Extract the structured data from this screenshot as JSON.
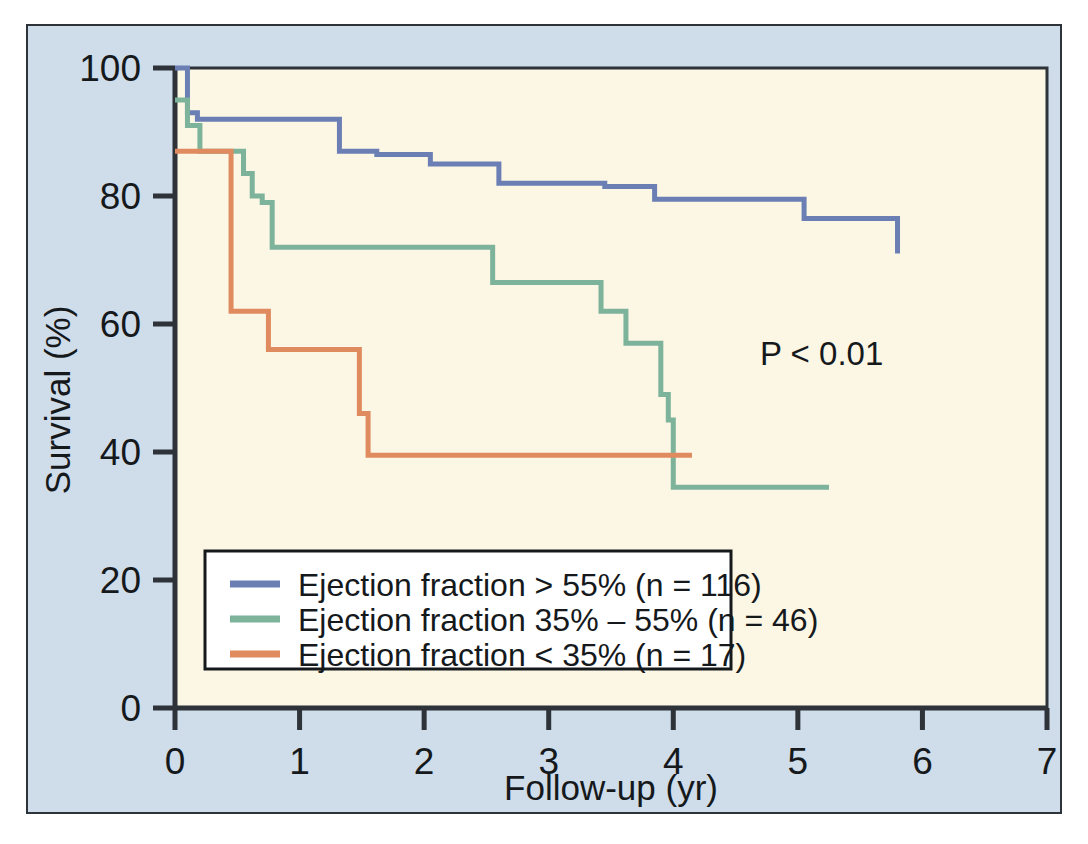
{
  "figure": {
    "background_color": "#cfdcea",
    "panel_color": "#fcf6e4",
    "frame_color": "#2d3338"
  },
  "annotation": {
    "p_value": "P < 0.01"
  },
  "legend": {
    "items": [
      {
        "label": "Ejection fraction > 55% (n = 116)",
        "color": "#6b7fb5"
      },
      {
        "label": "Ejection fraction 35% – 55% (n = 46)",
        "color": "#7cb39a"
      },
      {
        "label": "Ejection fraction < 35% (n = 17)",
        "color": "#e08b5f"
      }
    ]
  },
  "chart_data": {
    "type": "line",
    "title": "",
    "subtitle": "",
    "xlabel": "Follow-up (yr)",
    "ylabel": "Survival (%)",
    "xlim": [
      0,
      7
    ],
    "ylim": [
      0,
      100
    ],
    "xticks": [
      0,
      1,
      2,
      3,
      4,
      5,
      6,
      7
    ],
    "xticklabels": [
      "0",
      "1",
      "2",
      "3",
      "4",
      "5",
      "6",
      "7"
    ],
    "yticks": [
      0,
      20,
      40,
      60,
      80,
      100
    ],
    "yticklabels": [
      "0",
      "20",
      "40",
      "60",
      "80",
      "100"
    ],
    "grid": false,
    "legend_position": "lower-left",
    "annotations": [
      {
        "text": "P < 0.01",
        "x": 4.55,
        "y": 54
      }
    ],
    "step_style": "post",
    "series": [
      {
        "name": "Ejection fraction > 55% (n = 116)",
        "color": "#6b7fb5",
        "n": 116,
        "x": [
          0.0,
          0.06,
          0.1,
          0.18,
          0.72,
          1.32,
          1.62,
          2.05,
          2.6,
          3.35,
          3.45,
          3.85,
          5.05,
          5.12,
          5.8
        ],
        "y": [
          100,
          100,
          93,
          92,
          92,
          87,
          86.5,
          85,
          82,
          82,
          81.5,
          79.5,
          76.5,
          76.5,
          71
        ]
      },
      {
        "name": "Ejection fraction 35% – 55% (n = 46)",
        "color": "#7cb39a",
        "n": 46,
        "x": [
          0.0,
          0.08,
          0.1,
          0.2,
          0.35,
          0.55,
          0.62,
          0.7,
          0.78,
          2.5,
          2.55,
          3.35,
          3.42,
          3.5,
          3.62,
          3.78,
          3.9,
          3.96,
          4.0,
          5.25
        ],
        "y": [
          95,
          95,
          91,
          87,
          87,
          83.5,
          80,
          79,
          72,
          72,
          66.5,
          66.5,
          62,
          62,
          57,
          57,
          49,
          45,
          34.5,
          34.5
        ]
      },
      {
        "name": "Ejection fraction < 35% (n = 17)",
        "color": "#e08b5f",
        "n": 17,
        "x": [
          0.0,
          0.12,
          0.4,
          0.45,
          0.68,
          0.75,
          1.42,
          1.48,
          1.55,
          4.15
        ],
        "y": [
          87,
          87,
          87,
          62,
          62,
          56,
          56,
          46,
          39.5,
          39.5
        ]
      }
    ]
  }
}
